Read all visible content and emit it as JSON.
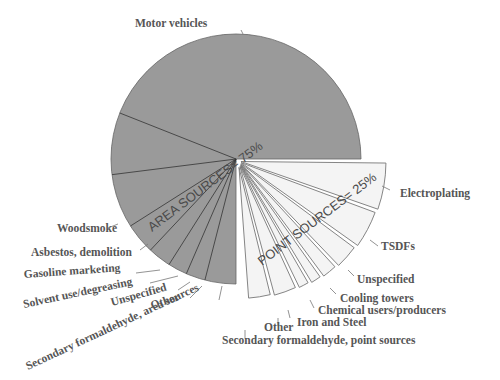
{
  "chart_data": {
    "type": "pie",
    "title": "",
    "groups": [
      {
        "name": "AREA SOURCES",
        "label": "AREA SOURCES= 75%",
        "percent": 75,
        "color": "#9a9a9a"
      },
      {
        "name": "POINT SOURCES",
        "label": "POINT SOURCES= 25%",
        "percent": 25,
        "color": "#f4f4f4",
        "exploded": true
      }
    ],
    "area_sources": [
      {
        "name": "Motor vehicles",
        "percent": 44
      },
      {
        "name": "Woodsmoke",
        "percent": 8
      },
      {
        "name": "Asbestos, demolition",
        "percent": 7
      },
      {
        "name": "Gasoline marketing",
        "percent": 4
      },
      {
        "name": "Solvent use/degreasing",
        "percent": 3
      },
      {
        "name": "Unspecified",
        "percent": 2.5
      },
      {
        "name": "Other",
        "percent": 2.5
      },
      {
        "name": "Secondary formaldehyde, area sources",
        "percent": 4
      }
    ],
    "point_sources": [
      {
        "name": "Electroplating",
        "percent": 5.5
      },
      {
        "name": "TSDFs",
        "percent": 4.5
      },
      {
        "name": "Unspecified",
        "percent": 3
      },
      {
        "name": "Cooling towers",
        "percent": 2
      },
      {
        "name": "Chemical users/producers",
        "percent": 1.5
      },
      {
        "name": "Iron and Steel",
        "percent": 1.5
      },
      {
        "name": "Other",
        "percent": 3
      },
      {
        "name": "Secondary formaldehyde, point sources",
        "percent": 3
      }
    ]
  },
  "labels": {
    "area_total": "AREA SOURCES= 75%",
    "point_total": "POINT SOURCES= 25%",
    "motor_vehicles": "Motor vehicles",
    "woodsmoke": "Woodsmoke",
    "asbestos": "Asbestos, demolition",
    "gasoline": "Gasoline marketing",
    "solvent": "Solvent use/degreasing",
    "area_unspecified": "Unspecified",
    "area_other": "Other",
    "area_secondary": "Secondary formaldehyde, area sources",
    "electroplating": "Electroplating",
    "tsdfs": "TSDFs",
    "point_unspecified": "Unspecified",
    "cooling": "Cooling towers",
    "chemical": "Chemical users/producers",
    "iron": "Iron and Steel",
    "point_other": "Other",
    "point_secondary": "Secondary formaldehyde, point sources"
  }
}
